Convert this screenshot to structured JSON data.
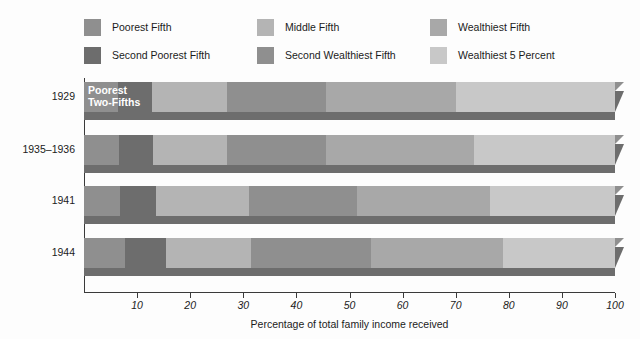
{
  "chart_data": {
    "type": "bar",
    "orientation": "horizontal",
    "stacked": true,
    "title": "",
    "xlabel": "Percentage of total family income received",
    "ylabel": "",
    "xlim": [
      0,
      100
    ],
    "xticks": [
      10,
      20,
      30,
      40,
      50,
      60,
      70,
      80,
      90,
      100
    ],
    "xtick_labels": [
      "10",
      "20",
      "30",
      "40",
      "50",
      "60",
      "70",
      "80",
      "90",
      "100"
    ],
    "grid": false,
    "legend_position": "top",
    "categories": [
      "1929",
      "1935–1936",
      "1941",
      "1944"
    ],
    "series": [
      {
        "name": "Poorest Fifth",
        "color": "#8f8f8f",
        "values": [
          6.4,
          6.5,
          6.8,
          7.8
        ]
      },
      {
        "name": "Second Poorest Fifth",
        "color": "#6d6d6d",
        "values": [
          6.4,
          6.5,
          6.7,
          7.7
        ]
      },
      {
        "name": "Middle Fifth",
        "color": "#b4b4b4",
        "values": [
          14.2,
          14.0,
          17.5,
          16.0
        ]
      },
      {
        "name": "Second Wealthiest Fifth",
        "color": "#8f8f8f",
        "values": [
          18.5,
          18.5,
          20.5,
          22.5
        ]
      },
      {
        "name": "Wealthiest Fifth",
        "color": "#a8a8a8",
        "values": [
          24.5,
          28.0,
          25.0,
          25.0
        ]
      },
      {
        "name": "Wealthiest 5 Percent",
        "color": "#c8c8c8",
        "values": [
          30.0,
          26.5,
          23.5,
          21.0
        ]
      }
    ],
    "boundaries": {
      "1929": [
        0,
        6.4,
        12.8,
        27.0,
        45.5,
        70.0,
        100
      ],
      "1935–1936": [
        0,
        6.5,
        13.0,
        27.0,
        45.5,
        73.5,
        100
      ],
      "1941": [
        0,
        6.8,
        13.5,
        31.0,
        51.5,
        76.5,
        100
      ],
      "1944": [
        0,
        7.8,
        15.5,
        31.5,
        54.0,
        79.0,
        100
      ]
    },
    "annotations": [
      {
        "text": "Poorest\nTwo-Fifths",
        "category": "1929",
        "x_start": 0,
        "x_end": 12.8
      }
    ]
  },
  "legend": {
    "items": [
      {
        "label": "Poorest Fifth",
        "color": "#8f8f8f"
      },
      {
        "label": "Middle Fifth",
        "color": "#b4b4b4"
      },
      {
        "label": "Wealthiest Fifth",
        "color": "#a8a8a8"
      },
      {
        "label": "Second Poorest Fifth",
        "color": "#6d6d6d"
      },
      {
        "label": "Second Wealthiest Fifth",
        "color": "#8f8f8f"
      },
      {
        "label": "Wealthiest 5 Percent",
        "color": "#c8c8c8"
      }
    ]
  },
  "axis": {
    "x_title": "Percentage of total family income received",
    "tick_labels": [
      "10",
      "20",
      "30",
      "40",
      "50",
      "60",
      "70",
      "80",
      "90",
      "100"
    ],
    "category_labels": [
      "1929",
      "1935–1936",
      "1941",
      "1944"
    ]
  },
  "bar_annotation": {
    "line1": "Poorest",
    "line2": "Two-Fifths"
  },
  "colors": {
    "poorest_fifth": "#8f8f8f",
    "second_poorest_fifth": "#6d6d6d",
    "middle_fifth": "#b4b4b4",
    "second_wealthiest_fifth": "#8f8f8f",
    "wealthiest_fifth": "#a8a8a8",
    "wealthiest_5_percent": "#c8c8c8",
    "axis": "#3a3a3a",
    "shadow": "#6d6d6d",
    "text": "#1b1b1b",
    "background": "#fdfdfd"
  }
}
